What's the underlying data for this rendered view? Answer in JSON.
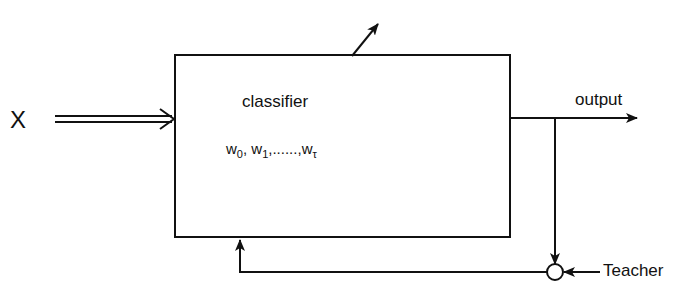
{
  "diagram": {
    "type": "block-diagram",
    "input_label": "X",
    "block": {
      "label": "classifier",
      "weights": {
        "w0": "w",
        "w0_sub": "0",
        "w1": "w",
        "w1_sub": "1",
        "ellipsis": ",......,",
        "wt": "w",
        "wt_sub": "τ",
        "sep": ", "
      }
    },
    "output_label": "output",
    "teacher_label": "Teacher",
    "colors": {
      "stroke": "#111111",
      "background": "#ffffff"
    }
  }
}
